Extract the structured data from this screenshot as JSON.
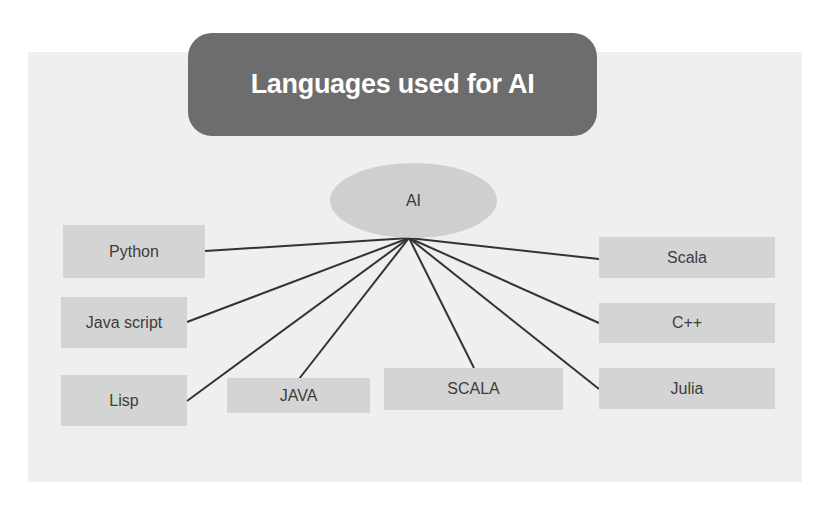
{
  "title": "Languages used for AI",
  "hub": {
    "label": "AI",
    "anchor": [
      409,
      238
    ]
  },
  "nodes": [
    {
      "id": "python",
      "label": "Python",
      "box": [
        63,
        225,
        142,
        53
      ],
      "edge_end": [
        205,
        251
      ]
    },
    {
      "id": "javascript",
      "label": "Java script",
      "box": [
        61,
        297,
        126,
        51
      ],
      "edge_end": [
        187,
        322
      ]
    },
    {
      "id": "lisp",
      "label": "Lisp",
      "box": [
        61,
        375,
        126,
        51
      ],
      "edge_end": [
        187,
        401
      ]
    },
    {
      "id": "java",
      "label": "JAVA",
      "box": [
        227,
        378,
        143,
        35
      ],
      "edge_end": [
        299,
        379
      ]
    },
    {
      "id": "scala-upper",
      "label": "SCALA",
      "box": [
        384,
        368,
        179,
        42
      ],
      "edge_end": [
        474,
        368
      ]
    },
    {
      "id": "scala",
      "label": "Scala",
      "box": [
        599,
        237,
        176,
        41
      ],
      "edge_end": [
        599,
        259
      ]
    },
    {
      "id": "cpp",
      "label": "C++",
      "box": [
        599,
        303,
        176,
        40
      ],
      "edge_end": [
        599,
        323
      ]
    },
    {
      "id": "julia",
      "label": "Julia",
      "box": [
        599,
        368,
        176,
        41
      ],
      "edge_end": [
        599,
        389
      ]
    }
  ],
  "colors": {
    "background": "#efefef",
    "title_fill": "#6d6d6d",
    "hub_fill": "#cfcfcf",
    "node_fill": "#d4d4d4",
    "edge": "#333333"
  }
}
